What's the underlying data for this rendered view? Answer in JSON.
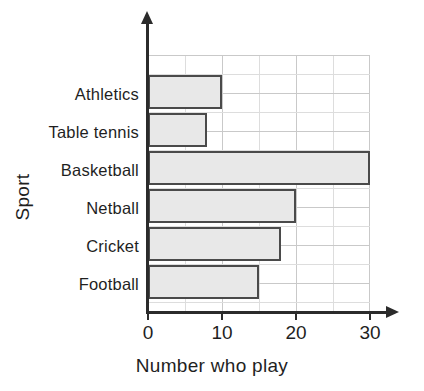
{
  "chart_data": {
    "type": "bar",
    "orientation": "horizontal",
    "title": "",
    "xlabel": "Number who play",
    "ylabel": "Sport",
    "categories": [
      "Athletics",
      "Table tennis",
      "Basketball",
      "Netball",
      "Cricket",
      "Football"
    ],
    "values": [
      10,
      8,
      30,
      20,
      18,
      15
    ],
    "xlim": [
      0,
      30
    ],
    "xticks": [
      0,
      10,
      20,
      30
    ],
    "xtick_labels": [
      "0",
      "10",
      "20",
      "30"
    ],
    "minor_tick_step": 5,
    "grid": true,
    "legend": false,
    "bar_fill_color": "#e8e8e8",
    "bar_border_color": "#4a4a4a",
    "axis_color": "#2b2b2b",
    "gridline_color": "#c9c9c9",
    "background_color": "#ffffff"
  },
  "axes": {
    "x_title": "Number who play",
    "y_title": "Sport"
  }
}
